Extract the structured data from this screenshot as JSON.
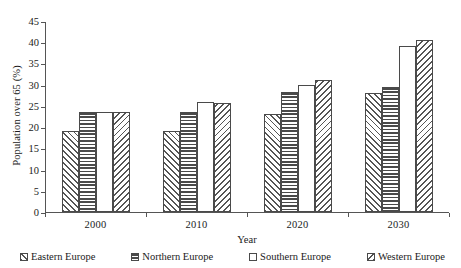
{
  "figure": {
    "title_remnant": "",
    "background": "#ffffff",
    "ink_color": "#4a4a4a"
  },
  "chart_data": {
    "type": "bar",
    "title": "",
    "xlabel": "Year",
    "ylabel": "Population over 65 (%)",
    "categories": [
      "2000",
      "2010",
      "2020",
      "2030"
    ],
    "ylim": [
      0,
      45
    ],
    "yticks": [
      0,
      5,
      10,
      15,
      20,
      25,
      30,
      35,
      40,
      45
    ],
    "ytick_labels": [
      "0",
      "5",
      "10",
      "15",
      "20",
      "25",
      "30",
      "35",
      "40",
      "45"
    ],
    "grid": false,
    "legend_position": "bottom",
    "series": [
      {
        "name": "Eastern Europe",
        "pattern": "diagonal-forward-hatch",
        "values": [
          19.0,
          19.2,
          23.2,
          28.0
        ]
      },
      {
        "name": "Northern Europe",
        "pattern": "horizontal-stripes",
        "values": [
          23.5,
          23.6,
          28.2,
          29.5
        ]
      },
      {
        "name": "Southern Europe",
        "pattern": "empty-white",
        "values": [
          23.5,
          26.0,
          30.0,
          39.0
        ]
      },
      {
        "name": "Western Europe",
        "pattern": "diagonal-backward-hatch",
        "values": [
          23.5,
          25.8,
          31.0,
          40.5
        ]
      }
    ]
  }
}
